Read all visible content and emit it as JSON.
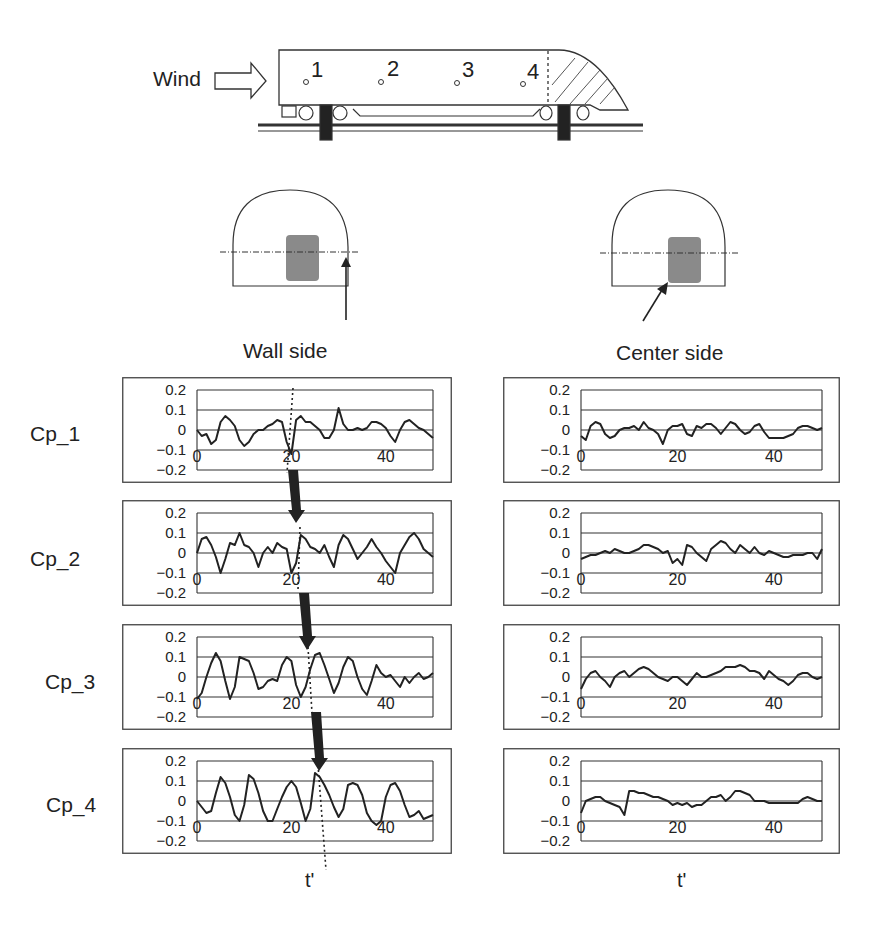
{
  "diagram": {
    "wind_label": "Wind",
    "tap_labels": [
      "1",
      "2",
      "3",
      "4"
    ],
    "columns": [
      {
        "title": "Wall side"
      },
      {
        "title": "Center side"
      }
    ],
    "xlabel": "t'"
  },
  "colors": {
    "line": "#222222",
    "grid": "#333333",
    "vehicle_fill": "#8a8a8a",
    "arrow": "#222222"
  },
  "chart_data": [
    {
      "type": "line",
      "panel": "Wall side",
      "title": "Cp_1",
      "ylabel": "Cp_1",
      "xlabel": "t'",
      "ylim": [
        -0.2,
        0.2
      ],
      "xlim": [
        0,
        50
      ],
      "yticks": [
        "0.2",
        "0.1",
        "0",
        "-0.1",
        "-0.2"
      ],
      "xticks": [
        "0",
        "20",
        "40"
      ],
      "grid": true,
      "x": [
        0,
        1,
        2,
        3,
        4,
        5,
        6,
        7,
        8,
        9,
        10,
        11,
        12,
        13,
        14,
        15,
        16,
        17,
        18,
        19,
        20,
        21,
        22,
        23,
        24,
        25,
        26,
        27,
        28,
        29,
        30,
        31,
        32,
        33,
        34,
        35,
        36,
        37,
        38,
        39,
        40,
        41,
        42,
        43,
        44,
        45,
        46,
        47,
        48,
        49,
        50
      ],
      "values": [
        0.0,
        -0.03,
        -0.02,
        -0.07,
        -0.05,
        0.04,
        0.07,
        0.05,
        0.02,
        -0.05,
        -0.08,
        -0.06,
        -0.02,
        0.0,
        0.0,
        0.02,
        0.03,
        0.05,
        0.04,
        -0.06,
        -0.12,
        0.05,
        0.07,
        0.04,
        0.04,
        0.02,
        0.0,
        -0.04,
        -0.04,
        0.0,
        0.11,
        0.03,
        0.0,
        0.0,
        0.01,
        0.0,
        0.01,
        0.04,
        0.04,
        0.03,
        0.01,
        -0.03,
        -0.06,
        0.0,
        0.04,
        0.05,
        0.03,
        0.01,
        0.0,
        -0.02,
        -0.04
      ],
      "annotation": "dotted line marking peak near t'=20"
    },
    {
      "type": "line",
      "panel": "Wall side",
      "title": "Cp_2",
      "ylabel": "Cp_2",
      "xlabel": "t'",
      "ylim": [
        -0.2,
        0.2
      ],
      "xlim": [
        0,
        50
      ],
      "yticks": [
        "0.2",
        "0.1",
        "0",
        "-0.1",
        "-0.2"
      ],
      "xticks": [
        "0",
        "20",
        "40"
      ],
      "grid": true,
      "x": [
        0,
        1,
        2,
        3,
        4,
        5,
        6,
        7,
        8,
        9,
        10,
        11,
        12,
        13,
        14,
        15,
        16,
        17,
        18,
        19,
        20,
        21,
        22,
        23,
        24,
        25,
        26,
        27,
        28,
        29,
        30,
        31,
        32,
        33,
        34,
        35,
        36,
        37,
        38,
        39,
        40,
        41,
        42,
        43,
        44,
        45,
        46,
        47,
        48,
        49,
        50
      ],
      "values": [
        0.0,
        0.07,
        0.08,
        0.04,
        -0.02,
        -0.1,
        -0.03,
        0.05,
        0.04,
        0.1,
        0.04,
        0.03,
        0.0,
        -0.07,
        0.0,
        0.03,
        0.0,
        0.05,
        0.03,
        0.02,
        -0.1,
        -0.05,
        0.09,
        0.07,
        0.03,
        0.02,
        0.0,
        0.04,
        -0.02,
        -0.07,
        0.04,
        0.09,
        0.07,
        0.02,
        -0.03,
        0.0,
        0.03,
        0.07,
        0.03,
        0.0,
        -0.04,
        -0.07,
        -0.1,
        0.0,
        0.04,
        0.08,
        0.1,
        0.07,
        0.02,
        0.0,
        -0.02
      ]
    },
    {
      "type": "line",
      "panel": "Wall side",
      "title": "Cp_3",
      "ylabel": "Cp_3",
      "xlabel": "t'",
      "ylim": [
        -0.2,
        0.2
      ],
      "xlim": [
        0,
        50
      ],
      "yticks": [
        "0.2",
        "0.1",
        "0",
        "-0.1",
        "-0.2"
      ],
      "xticks": [
        "0",
        "20",
        "40"
      ],
      "grid": true,
      "x": [
        0,
        1,
        2,
        3,
        4,
        5,
        6,
        7,
        8,
        9,
        10,
        11,
        12,
        13,
        14,
        15,
        16,
        17,
        18,
        19,
        20,
        21,
        22,
        23,
        24,
        25,
        26,
        27,
        28,
        29,
        30,
        31,
        32,
        33,
        34,
        35,
        36,
        37,
        38,
        39,
        40,
        41,
        42,
        43,
        44,
        45,
        46,
        47,
        48,
        49,
        50
      ],
      "values": [
        -0.11,
        -0.08,
        0.0,
        0.07,
        0.12,
        0.08,
        -0.02,
        -0.11,
        -0.05,
        0.1,
        0.09,
        0.08,
        0.02,
        -0.06,
        -0.05,
        -0.02,
        -0.01,
        -0.02,
        0.06,
        0.1,
        0.08,
        -0.04,
        -0.1,
        -0.05,
        0.04,
        0.11,
        0.12,
        0.06,
        -0.01,
        -0.08,
        -0.03,
        0.05,
        0.1,
        0.08,
        0.0,
        -0.06,
        -0.09,
        -0.02,
        0.06,
        0.02,
        0.0,
        0.01,
        -0.02,
        -0.05,
        0.0,
        -0.03,
        0.0,
        0.02,
        -0.01,
        0.0,
        0.02
      ]
    },
    {
      "type": "line",
      "panel": "Wall side",
      "title": "Cp_4",
      "ylabel": "Cp_4",
      "xlabel": "t'",
      "ylim": [
        -0.2,
        0.2
      ],
      "xlim": [
        0,
        50
      ],
      "yticks": [
        "0.2",
        "0.1",
        "0",
        "-0.1",
        "-0.2"
      ],
      "xticks": [
        "0",
        "20",
        "40"
      ],
      "grid": true,
      "x": [
        0,
        1,
        2,
        3,
        4,
        5,
        6,
        7,
        8,
        9,
        10,
        11,
        12,
        13,
        14,
        15,
        16,
        17,
        18,
        19,
        20,
        21,
        22,
        23,
        24,
        25,
        26,
        27,
        28,
        29,
        30,
        31,
        32,
        33,
        34,
        35,
        36,
        37,
        38,
        39,
        40,
        41,
        42,
        43,
        44,
        45,
        46,
        47,
        48,
        49,
        50
      ],
      "values": [
        0.0,
        -0.03,
        -0.06,
        -0.05,
        0.04,
        0.12,
        0.09,
        0.02,
        -0.07,
        -0.1,
        -0.02,
        0.13,
        0.11,
        0.04,
        -0.05,
        -0.1,
        -0.1,
        -0.04,
        0.02,
        0.07,
        0.1,
        0.07,
        -0.01,
        -0.1,
        -0.04,
        0.14,
        0.12,
        0.08,
        0.03,
        -0.03,
        -0.08,
        -0.04,
        0.08,
        0.09,
        0.08,
        0.03,
        -0.06,
        -0.1,
        -0.12,
        -0.1,
        0.02,
        0.08,
        0.09,
        0.05,
        -0.02,
        -0.08,
        -0.07,
        -0.05,
        -0.09,
        -0.08,
        -0.07
      ]
    },
    {
      "type": "line",
      "panel": "Center side",
      "title": "Cp_1",
      "ylabel": "Cp_1",
      "xlabel": "t'",
      "ylim": [
        -0.2,
        0.2
      ],
      "xlim": [
        0,
        50
      ],
      "yticks": [
        "0.2",
        "0.1",
        "0",
        "-0.1",
        "-0.2"
      ],
      "xticks": [
        "0",
        "20",
        "40"
      ],
      "grid": true,
      "x": [
        0,
        1,
        2,
        3,
        4,
        5,
        6,
        7,
        8,
        9,
        10,
        11,
        12,
        13,
        14,
        15,
        16,
        17,
        18,
        19,
        20,
        21,
        22,
        23,
        24,
        25,
        26,
        27,
        28,
        29,
        30,
        31,
        32,
        33,
        34,
        35,
        36,
        37,
        38,
        39,
        40,
        41,
        42,
        43,
        44,
        45,
        46,
        47,
        48,
        49,
        50
      ],
      "values": [
        -0.03,
        -0.05,
        0.02,
        0.04,
        0.03,
        -0.02,
        -0.04,
        -0.03,
        0.0,
        0.01,
        0.01,
        0.02,
        0.0,
        0.04,
        0.01,
        0.0,
        -0.02,
        -0.07,
        0.0,
        0.02,
        0.02,
        0.03,
        -0.02,
        -0.03,
        0.02,
        0.01,
        0.03,
        0.03,
        0.01,
        -0.02,
        0.01,
        0.04,
        0.03,
        0.0,
        -0.02,
        -0.01,
        0.02,
        0.03,
        -0.01,
        -0.04,
        -0.04,
        -0.04,
        -0.04,
        -0.03,
        -0.02,
        0.01,
        0.02,
        0.02,
        0.01,
        0.0,
        0.01
      ]
    },
    {
      "type": "line",
      "panel": "Center side",
      "title": "Cp_2",
      "ylabel": "Cp_2",
      "xlabel": "t'",
      "ylim": [
        -0.2,
        0.2
      ],
      "xlim": [
        0,
        50
      ],
      "yticks": [
        "0.2",
        "0.1",
        "0",
        "-0.1",
        "-0.2"
      ],
      "xticks": [
        "0",
        "20",
        "40"
      ],
      "grid": true,
      "x": [
        0,
        1,
        2,
        3,
        4,
        5,
        6,
        7,
        8,
        9,
        10,
        11,
        12,
        13,
        14,
        15,
        16,
        17,
        18,
        19,
        20,
        21,
        22,
        23,
        24,
        25,
        26,
        27,
        28,
        29,
        30,
        31,
        32,
        33,
        34,
        35,
        36,
        37,
        38,
        39,
        40,
        41,
        42,
        43,
        44,
        45,
        46,
        47,
        48,
        49,
        50
      ],
      "values": [
        -0.03,
        -0.02,
        -0.01,
        -0.01,
        0.0,
        0.01,
        0.0,
        0.02,
        0.01,
        0.0,
        0.0,
        0.01,
        0.02,
        0.04,
        0.04,
        0.03,
        0.02,
        0.0,
        0.01,
        -0.05,
        -0.03,
        -0.06,
        0.04,
        0.03,
        0.0,
        -0.02,
        -0.04,
        0.02,
        0.04,
        0.06,
        0.05,
        0.02,
        0.0,
        0.04,
        0.02,
        0.0,
        0.03,
        0.0,
        -0.01,
        0.01,
        0.0,
        -0.01,
        -0.02,
        -0.02,
        -0.01,
        -0.01,
        -0.01,
        0.0,
        0.0,
        -0.03,
        0.02
      ]
    },
    {
      "type": "line",
      "panel": "Center side",
      "title": "Cp_3",
      "ylabel": "Cp_3",
      "xlabel": "t'",
      "ylim": [
        -0.2,
        0.2
      ],
      "xlim": [
        0,
        50
      ],
      "yticks": [
        "0.2",
        "0.1",
        "0",
        "-0.1",
        "-0.2"
      ],
      "xticks": [
        "0",
        "20",
        "40"
      ],
      "grid": true,
      "x": [
        0,
        1,
        2,
        3,
        4,
        5,
        6,
        7,
        8,
        9,
        10,
        11,
        12,
        13,
        14,
        15,
        16,
        17,
        18,
        19,
        20,
        21,
        22,
        23,
        24,
        25,
        26,
        27,
        28,
        29,
        30,
        31,
        32,
        33,
        34,
        35,
        36,
        37,
        38,
        39,
        40,
        41,
        42,
        43,
        44,
        45,
        46,
        47,
        48,
        49,
        50
      ],
      "values": [
        -0.06,
        -0.01,
        0.02,
        0.03,
        0.0,
        -0.02,
        -0.05,
        0.0,
        0.02,
        0.03,
        0.0,
        0.02,
        0.04,
        0.05,
        0.04,
        0.02,
        0.0,
        -0.01,
        -0.02,
        0.0,
        0.0,
        -0.02,
        -0.04,
        -0.01,
        0.02,
        0.0,
        0.0,
        0.01,
        0.02,
        0.03,
        0.05,
        0.05,
        0.05,
        0.06,
        0.05,
        0.03,
        0.03,
        0.02,
        -0.01,
        0.03,
        0.01,
        -0.01,
        -0.02,
        -0.04,
        -0.02,
        0.01,
        0.02,
        0.02,
        0.0,
        -0.01,
        0.0
      ]
    },
    {
      "type": "line",
      "panel": "Center side",
      "title": "Cp_4",
      "ylabel": "Cp_4",
      "xlabel": "t'",
      "ylim": [
        -0.2,
        0.2
      ],
      "xlim": [
        0,
        50
      ],
      "yticks": [
        "0.2",
        "0.1",
        "0",
        "-0.1",
        "-0.2"
      ],
      "xticks": [
        "0",
        "20",
        "40"
      ],
      "grid": true,
      "x": [
        0,
        1,
        2,
        3,
        4,
        5,
        6,
        7,
        8,
        9,
        10,
        11,
        12,
        13,
        14,
        15,
        16,
        17,
        18,
        19,
        20,
        21,
        22,
        23,
        24,
        25,
        26,
        27,
        28,
        29,
        30,
        31,
        32,
        33,
        34,
        35,
        36,
        37,
        38,
        39,
        40,
        41,
        42,
        43,
        44,
        45,
        46,
        47,
        48,
        49,
        50
      ],
      "values": [
        -0.06,
        0.0,
        0.01,
        0.02,
        0.02,
        0.0,
        -0.01,
        -0.02,
        -0.03,
        -0.07,
        0.05,
        0.05,
        0.04,
        0.04,
        0.03,
        0.02,
        0.02,
        0.01,
        0.0,
        -0.02,
        -0.01,
        -0.02,
        -0.01,
        -0.03,
        -0.02,
        -0.02,
        0.0,
        0.02,
        0.02,
        0.03,
        0.0,
        0.02,
        0.05,
        0.05,
        0.04,
        0.03,
        0.0,
        0.0,
        0.0,
        -0.01,
        -0.01,
        -0.01,
        -0.01,
        -0.01,
        -0.01,
        -0.01,
        0.01,
        0.02,
        0.01,
        0.0,
        0.0
      ]
    }
  ]
}
